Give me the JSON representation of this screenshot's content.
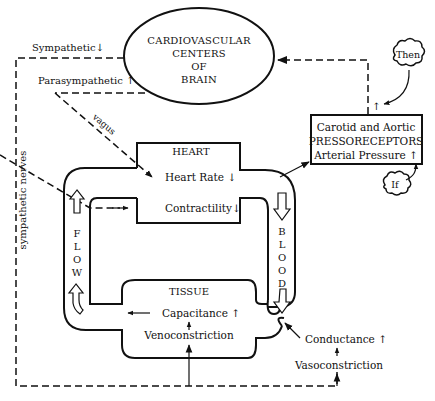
{
  "brain": {
    "line1": "CARDIOVASCULAR",
    "line2": "CENTERS",
    "line3": "OF",
    "line4": "BRAIN"
  },
  "nerves": {
    "sympathetic": "Sympathetic",
    "sympathetic_dir": "↓",
    "parasympathetic": "Parasympathetic",
    "parasympathetic_dir": "↑",
    "vagus": "vagus",
    "sympathetic_nerves": "sympathetic nerves"
  },
  "heart": {
    "title": "HEART",
    "heart_rate": "Heart Rate",
    "heart_rate_dir": "↓",
    "contractility": "Contractility",
    "contractility_dir": "↓"
  },
  "receptors": {
    "line1": "Carotid and Aortic",
    "line2": "PRESSORECEPTORS",
    "line3": "Arterial Pressure",
    "line3_dir": "↑",
    "signal_dir": "↑"
  },
  "clouds": {
    "then": "Then",
    "if": "If"
  },
  "loop": {
    "flow_letters": [
      "F",
      "L",
      "O",
      "W"
    ],
    "blood_letters": [
      "B",
      "L",
      "O",
      "O",
      "D"
    ]
  },
  "tissue": {
    "title": "TISSUE",
    "capacitance": "Capacitance",
    "capacitance_dir": "↑",
    "venoconstriction": "Venoconstriction"
  },
  "resistance": {
    "conductance": "Conductance",
    "conductance_dir": "↑",
    "vasoconstriction": "Vasoconstriction"
  }
}
